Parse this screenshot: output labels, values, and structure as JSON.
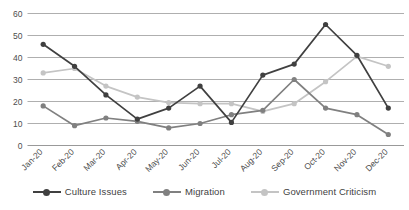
{
  "chart_data": {
    "type": "line",
    "title": "",
    "xlabel": "",
    "ylabel": "",
    "ylim": [
      0,
      60
    ],
    "yticks": [
      0,
      10,
      20,
      30,
      40,
      50,
      60
    ],
    "grid": true,
    "legend_position": "bottom",
    "categories": [
      "Jan-20",
      "Feb-20",
      "Mar-20",
      "Apr-20",
      "May-20",
      "Jun-20",
      "Jul-20",
      "Aug-20",
      "Sep-20",
      "Oct-20",
      "Nov-20",
      "Dec-20"
    ],
    "series": [
      {
        "name": "Culture Issues",
        "color": "#404040",
        "values": [
          46,
          36,
          23,
          12,
          17,
          27,
          10.5,
          32,
          37,
          55,
          41,
          17
        ]
      },
      {
        "name": "Migration",
        "color": "#808080",
        "values": [
          18,
          9,
          12.5,
          11,
          8,
          10,
          14,
          16,
          30,
          17,
          14,
          5
        ]
      },
      {
        "name": "Government Criticism",
        "color": "#c4c4c4",
        "values": [
          33,
          35,
          27,
          22,
          19.5,
          19,
          19,
          15.5,
          19,
          29,
          40.5,
          36
        ]
      }
    ]
  },
  "legend": {
    "items": [
      {
        "label": "Culture Issues",
        "color": "#404040"
      },
      {
        "label": "Migration",
        "color": "#808080"
      },
      {
        "label": "Government Criticism",
        "color": "#c4c4c4"
      }
    ]
  }
}
